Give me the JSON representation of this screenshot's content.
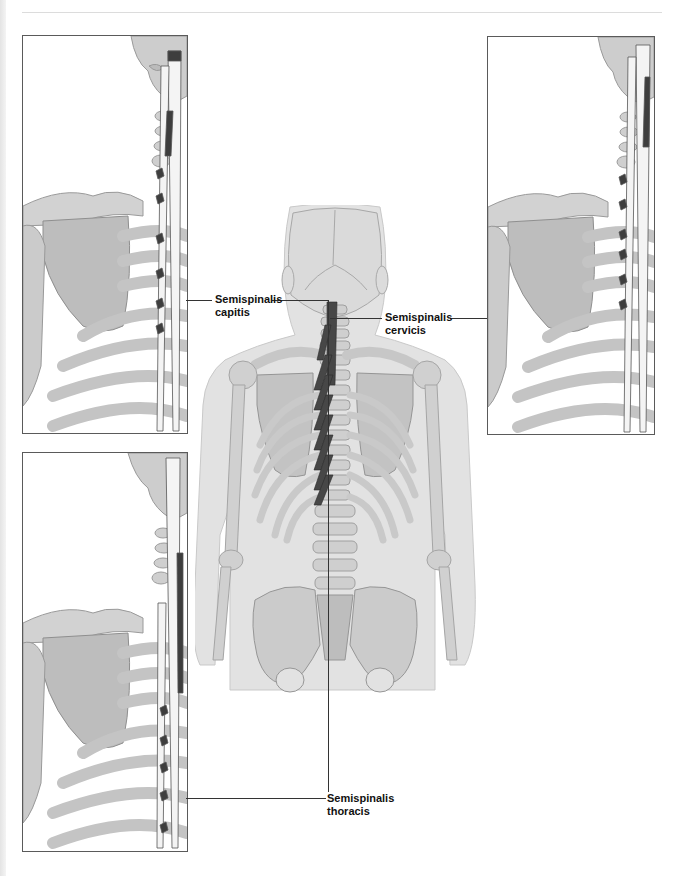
{
  "figure": {
    "type": "anatomical-illustration",
    "colors": {
      "bone": "#cfcfcf",
      "bone_shade": "#a9a9a9",
      "skin": "#e3e3e3",
      "muscle_dark": "#4a4a4a",
      "muscle_light": "#f6f6f6",
      "leader_line": "#333333",
      "panel_border": "#5a5a5a"
    }
  },
  "labels": {
    "capitis": {
      "line1": "Semispinalis",
      "line2": "capitis"
    },
    "cervicis": {
      "line1": "Semispinalis",
      "line2": "cervicis"
    },
    "thoracis": {
      "line1": "Semispinalis",
      "line2": "thoracis"
    }
  },
  "panels": [
    {
      "id": "top-left",
      "highlight": "Semispinalis capitis"
    },
    {
      "id": "top-right",
      "highlight": "Semispinalis cervicis"
    },
    {
      "id": "bottom-left",
      "highlight": "Semispinalis thoracis"
    }
  ]
}
